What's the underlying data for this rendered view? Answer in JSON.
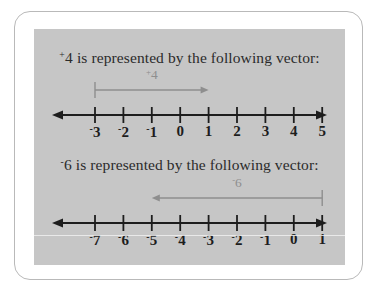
{
  "figure": {
    "background_color": "#c6c6c6",
    "frame_color": "#b9b9b9",
    "axis_color": "#1d1d1d",
    "vector_color": "#8e8e8e",
    "label_color": "#1d1d1d"
  },
  "sections": [
    {
      "id": "positive",
      "caption_sign": "+",
      "caption_value": "4",
      "caption_text": " is represented by the following vector:",
      "vector_label_sign": "+",
      "vector_label_value": "4",
      "vector_from": 0,
      "vector_to": 4,
      "vector_direction": "right",
      "ticks": [
        {
          "sign": "-",
          "value": "3"
        },
        {
          "sign": "-",
          "value": "2"
        },
        {
          "sign": "-",
          "value": "1"
        },
        {
          "sign": "",
          "value": "0"
        },
        {
          "sign": "",
          "value": "1"
        },
        {
          "sign": "",
          "value": "2"
        },
        {
          "sign": "",
          "value": "3"
        },
        {
          "sign": "",
          "value": "4"
        },
        {
          "sign": "",
          "value": "5"
        }
      ]
    },
    {
      "id": "negative",
      "caption_sign": "-",
      "caption_value": "6",
      "caption_text": " is represented by the following vector:",
      "vector_label_sign": "-",
      "vector_label_value": "6",
      "vector_from": 8,
      "vector_to": 2,
      "vector_direction": "left",
      "ticks": [
        {
          "sign": "-",
          "value": "7"
        },
        {
          "sign": "-",
          "value": "6"
        },
        {
          "sign": "-",
          "value": "5"
        },
        {
          "sign": "-",
          "value": "4"
        },
        {
          "sign": "-",
          "value": "3"
        },
        {
          "sign": "-",
          "value": "2"
        },
        {
          "sign": "-",
          "value": "1"
        },
        {
          "sign": "",
          "value": "0"
        },
        {
          "sign": "",
          "value": "1"
        }
      ]
    }
  ],
  "geometry": {
    "tick_start_x": 61,
    "tick_spacing": 28.4,
    "tick_count": 9,
    "axis_y": 42,
    "tick_half_height": 8,
    "arrow_left_x": 18,
    "arrow_right_x": 293,
    "vector_y": 17,
    "vector_stem_top": 9,
    "vector_stem_bottom": 25
  }
}
